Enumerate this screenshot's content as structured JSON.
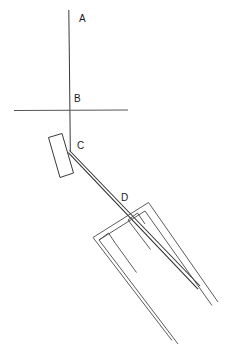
{
  "figure": {
    "width": 230,
    "height": 353,
    "background_color": "#ffffff",
    "line_color": "#3a3a3a",
    "label_color": "#1a1a1a"
  },
  "labels": {
    "a": "A",
    "b": "B",
    "c": "C",
    "d": "D"
  },
  "label_positions": {
    "a": {
      "x": 79,
      "y": 14
    },
    "b": {
      "x": 74,
      "y": 94
    },
    "c": {
      "x": 77,
      "y": 141
    },
    "d": {
      "x": 121,
      "y": 193
    }
  },
  "geometry": {
    "vertical_line": {
      "x1": 68.5,
      "y1": 10,
      "x2": 70.5,
      "y2": 151
    },
    "horizontal_axis": {
      "x1": 14,
      "y1": 110,
      "x2": 128,
      "y2": 110
    },
    "vane_rect": [
      {
        "x": 48.5,
        "y": 137.5
      },
      {
        "x": 62.0,
        "y": 133.5
      },
      {
        "x": 73.5,
        "y": 173.0
      },
      {
        "x": 60.0,
        "y": 177.5
      }
    ],
    "ray_upper": {
      "x1": 69.5,
      "y1": 150.5,
      "x2": 200.0,
      "y2": 286.0
    },
    "ray_lower": {
      "x1": 68.5,
      "y1": 152.5,
      "x2": 198.0,
      "y2": 289.0
    },
    "fork_outer": [
      {
        "x": 93.0,
        "y": 237.5
      },
      {
        "x": 148.5,
        "y": 202.5
      },
      {
        "x": 218.0,
        "y": 302.0
      }
    ],
    "fork_inner": [
      {
        "x": 99.0,
        "y": 240.0
      },
      {
        "x": 145.0,
        "y": 211.0
      },
      {
        "x": 212.0,
        "y": 305.5
      }
    ],
    "fork_prong_left_outer": [
      {
        "x": 93.0,
        "y": 237.5
      },
      {
        "x": 172.0,
        "y": 340.5
      }
    ],
    "fork_prong_left_inner": [
      {
        "x": 99.0,
        "y": 240.0
      },
      {
        "x": 178.0,
        "y": 344.0
      }
    ],
    "fork_notch_left": [
      {
        "x": 99.0,
        "y": 240.0
      },
      {
        "x": 108.0,
        "y": 233.0
      },
      {
        "x": 115.0,
        "y": 243.0
      }
    ],
    "fork_notch_right": [
      {
        "x": 128.0,
        "y": 220.0
      },
      {
        "x": 137.0,
        "y": 213.0
      },
      {
        "x": 145.0,
        "y": 224.0
      }
    ],
    "stub_left": {
      "x1": 115.0,
      "y1": 243.0,
      "x2": 136.0,
      "y2": 272.0
    },
    "stub_right": {
      "x1": 128.0,
      "y1": 220.0,
      "x2": 150.0,
      "y2": 249.0
    }
  }
}
